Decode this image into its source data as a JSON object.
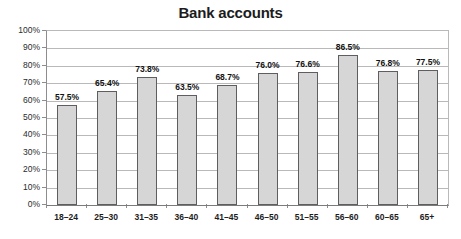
{
  "chart_data": {
    "type": "bar",
    "title": "Bank accounts",
    "xlabel": "",
    "ylabel": "",
    "ylim": [
      0,
      100
    ],
    "ytick_labels": [
      "0%",
      "10%",
      "20%",
      "30%",
      "40%",
      "50%",
      "60%",
      "70%",
      "80%",
      "90%",
      "100%"
    ],
    "ytick_values": [
      0,
      10,
      20,
      30,
      40,
      50,
      60,
      70,
      80,
      90,
      100
    ],
    "grid": true,
    "legend": "none",
    "categories": [
      "18–24",
      "25–30",
      "31–35",
      "36–40",
      "41–45",
      "46–50",
      "51–55",
      "56–60",
      "60–65",
      "65+"
    ],
    "values": [
      57.5,
      65.4,
      73.8,
      63.5,
      68.7,
      76.0,
      76.6,
      86.5,
      76.8,
      77.5
    ],
    "data_labels": [
      "57.5%",
      "65.4%",
      "73.8%",
      "63.5%",
      "68.7%",
      "76.0%",
      "76.6%",
      "86.5%",
      "76.8%",
      "77.5%"
    ],
    "bar_color": "#d6d6d6",
    "bar_border_color": "#5e5e5e",
    "grid_color": "#b9b9b9",
    "axis_color": "#7b7b7b"
  }
}
